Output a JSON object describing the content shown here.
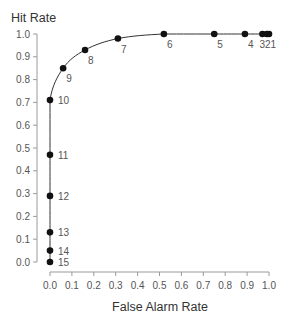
{
  "chart_data": {
    "type": "scatter",
    "subtype": "ROC curve with connecting line",
    "title": "",
    "xlabel": "False Alarm Rate",
    "ylabel": "Hit Rate",
    "xlim": [
      0.0,
      1.0
    ],
    "ylim": [
      0.0,
      1.0
    ],
    "x_ticks": [
      "0.0",
      "0.1",
      "0.2",
      "0.3",
      "0.4",
      "0.5",
      "0.6",
      "0.7",
      "0.8",
      "0.9",
      "1.0"
    ],
    "y_ticks": [
      "0.0",
      "0.1",
      "0.2",
      "0.3",
      "0.4",
      "0.5",
      "0.6",
      "0.7",
      "0.8",
      "0.9",
      "1.0"
    ],
    "grid": false,
    "legend": null,
    "points": [
      {
        "label": "15",
        "x": 0.0,
        "y": 0.0
      },
      {
        "label": "14",
        "x": 0.0,
        "y": 0.05
      },
      {
        "label": "13",
        "x": 0.0,
        "y": 0.13
      },
      {
        "label": "12",
        "x": 0.0,
        "y": 0.29
      },
      {
        "label": "11",
        "x": 0.0,
        "y": 0.47
      },
      {
        "label": "10",
        "x": 0.0,
        "y": 0.71
      },
      {
        "label": "9",
        "x": 0.06,
        "y": 0.85
      },
      {
        "label": "8",
        "x": 0.16,
        "y": 0.93
      },
      {
        "label": "7",
        "x": 0.31,
        "y": 0.98
      },
      {
        "label": "6",
        "x": 0.52,
        "y": 1.0
      },
      {
        "label": "5",
        "x": 0.75,
        "y": 1.0
      },
      {
        "label": "4",
        "x": 0.89,
        "y": 1.0
      },
      {
        "label": "3",
        "x": 0.97,
        "y": 1.0
      },
      {
        "label": "2",
        "x": 0.99,
        "y": 1.0
      },
      {
        "label": "1",
        "x": 1.0,
        "y": 1.0
      }
    ],
    "point_label_positions": {
      "right": [
        "15",
        "14",
        "13",
        "12",
        "11",
        "10"
      ],
      "below_right": [
        "9",
        "8",
        "7",
        "6",
        "5",
        "4"
      ],
      "combined_below": {
        "text": "321",
        "points": [
          "3",
          "2",
          "1"
        ]
      }
    },
    "colors": {
      "points": "#111111",
      "curve": "#333333",
      "axis": "#9a9a9a",
      "text": "#555555"
    }
  }
}
